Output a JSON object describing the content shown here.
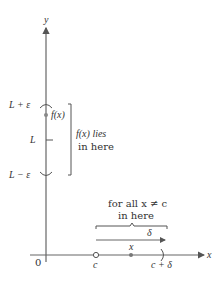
{
  "diagram": {
    "type": "epsilon-delta limit definition illustration",
    "axes": {
      "x_label": "x",
      "y_label": "y",
      "origin_label": "0"
    },
    "y_axis_labels": {
      "upper": "L + ε",
      "middle": "L",
      "lower": "L − ε"
    },
    "point_label": "f(x)",
    "bracket_text": [
      "f(x) lies",
      "in here"
    ],
    "x_axis_labels": {
      "c": "c",
      "x": "x",
      "c_plus_delta": "c + δ"
    },
    "brace_text": [
      "for all x ≠ c",
      "in here"
    ],
    "delta_label": "δ",
    "colors": {
      "axis": "#555555",
      "text": "#333333",
      "point": "#777777",
      "background": "#ffffff"
    }
  }
}
